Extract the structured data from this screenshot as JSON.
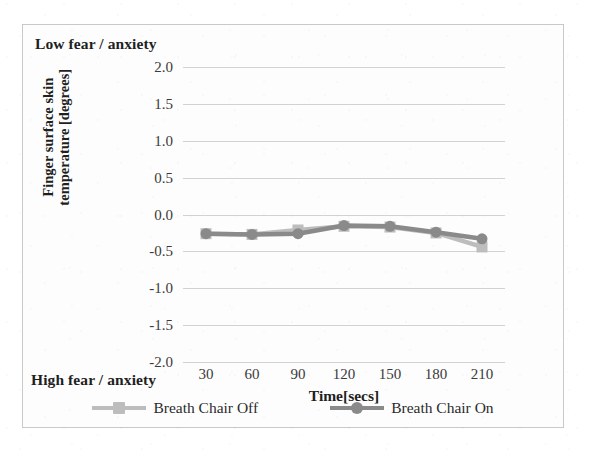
{
  "chart_data": {
    "type": "line",
    "title": "",
    "xlabel": "Time[secs]",
    "ylabel": "Finger surface skin temperature [degrees]",
    "ylabel_line1": "Finger surface skin",
    "ylabel_line2": "temperature [degrees]",
    "categories": [
      30,
      60,
      90,
      120,
      150,
      180,
      210
    ],
    "x": [
      30,
      60,
      90,
      120,
      150,
      180,
      210
    ],
    "xtick_labels": [
      "30",
      "60",
      "90",
      "120",
      "150",
      "180",
      "210"
    ],
    "ytick_labels": [
      "2.0",
      "1.5",
      "1.0",
      "0.5",
      "0.0",
      "-0.5",
      "-1.0",
      "-1.5",
      "-2.0"
    ],
    "ytick_values": [
      2.0,
      1.5,
      1.0,
      0.5,
      0.0,
      -0.5,
      -1.0,
      -1.5,
      -2.0
    ],
    "ylim": [
      -2.0,
      2.0
    ],
    "grid": "horizontal",
    "legend_position": "bottom",
    "series": [
      {
        "name": "Breath Chair Off",
        "color": "#bdbdbd",
        "marker": "square",
        "values": [
          -0.26,
          -0.27,
          -0.21,
          -0.16,
          -0.17,
          -0.25,
          -0.44
        ]
      },
      {
        "name": "Breath Chair On",
        "color": "#8a8a8a",
        "marker": "circle",
        "values": [
          -0.26,
          -0.27,
          -0.26,
          -0.15,
          -0.16,
          -0.24,
          -0.33
        ]
      }
    ],
    "annotations": [
      {
        "text": "Low fear / anxiety",
        "position": "top-left"
      },
      {
        "text": "High fear / anxiety",
        "position": "bottom-left"
      }
    ]
  },
  "annotations": {
    "low": "Low fear / anxiety",
    "high": "High fear / anxiety"
  },
  "colors": {
    "series_off": "#bdbdbd",
    "series_on": "#8a8a8a",
    "grid": "#d2d2d2",
    "border": "#c9c9c9",
    "text": "#1f1f1f"
  }
}
